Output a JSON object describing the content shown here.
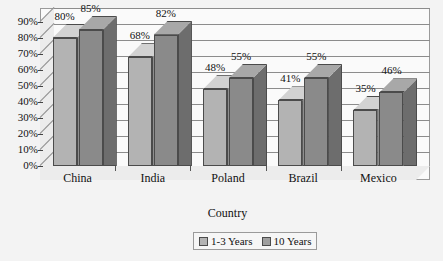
{
  "chart_data": {
    "type": "bar",
    "title": "",
    "xlabel": "Country",
    "ylabel": "",
    "categories": [
      "China",
      "India",
      "Poland",
      "Brazil",
      "Mexico"
    ],
    "series": [
      {
        "name": "1-3 Years",
        "values": [
          80,
          68,
          48,
          41,
          35
        ],
        "color": "#b3b3b3"
      },
      {
        "name": "10 Years",
        "values": [
          85,
          82,
          55,
          55,
          46
        ],
        "color": "#8a8a8a"
      }
    ],
    "value_labels": {
      "1-3 Years": [
        "80%",
        "68%",
        "48%",
        "41%",
        "35%"
      ],
      "10 Years": [
        "85%",
        "82%",
        "55%",
        "55%",
        "46%"
      ]
    },
    "ylim": [
      0,
      90
    ],
    "yticks": [
      0,
      10,
      20,
      30,
      40,
      50,
      60,
      70,
      80,
      90
    ],
    "ytick_labels": [
      "0%",
      "10%",
      "20%",
      "30%",
      "40%",
      "50%",
      "60%",
      "70%",
      "80%",
      "90%"
    ],
    "grid": true,
    "legend_position": "bottom",
    "style": "3d-clustered-column"
  },
  "axis": {
    "x_title": "Country"
  },
  "legend": {
    "items": [
      {
        "label": "1-3 Years"
      },
      {
        "label": "10 Years"
      }
    ]
  }
}
